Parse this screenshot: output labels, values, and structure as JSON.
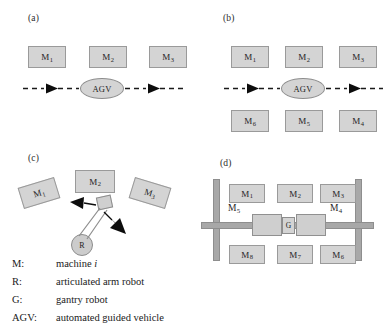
{
  "figure": {
    "panels": [
      {
        "id": "a",
        "label": "(a)",
        "machines": [
          {
            "name": "M",
            "index": "1"
          },
          {
            "name": "M",
            "index": "2"
          },
          {
            "name": "M",
            "index": "3"
          }
        ],
        "vehicle": "AGV"
      },
      {
        "id": "b",
        "label": "(b)",
        "machines_top": [
          {
            "name": "M",
            "index": "1"
          },
          {
            "name": "M",
            "index": "2"
          },
          {
            "name": "M",
            "index": "3"
          }
        ],
        "machines_bottom": [
          {
            "name": "M",
            "index": "6"
          },
          {
            "name": "M",
            "index": "5"
          },
          {
            "name": "M",
            "index": "4"
          }
        ],
        "vehicle": "AGV"
      },
      {
        "id": "c",
        "label": "(c)",
        "machines": [
          {
            "name": "M",
            "index": "1"
          },
          {
            "name": "M",
            "index": "2"
          },
          {
            "name": "M",
            "index": "3"
          }
        ],
        "robot": "R"
      },
      {
        "id": "d",
        "label": "(d)",
        "machines_top": [
          {
            "name": "M",
            "index": "1"
          },
          {
            "name": "M",
            "index": "2"
          },
          {
            "name": "M",
            "index": "3"
          }
        ],
        "machines_mid": [
          {
            "name": "M",
            "index": "5"
          },
          {
            "name": "M",
            "index": "4"
          }
        ],
        "machines_bottom": [
          {
            "name": "M",
            "index": "8"
          },
          {
            "name": "M",
            "index": "7"
          },
          {
            "name": "M",
            "index": "6"
          }
        ],
        "robot": "G"
      }
    ]
  },
  "legend": {
    "rows": [
      {
        "key": "M:",
        "key_sub": "i",
        "value": "machine ",
        "value_italic": "i"
      },
      {
        "key": "R:",
        "key_sub": "",
        "value": "articulated arm robot",
        "value_italic": ""
      },
      {
        "key": "G:",
        "key_sub": "",
        "value": "gantry robot",
        "value_italic": ""
      },
      {
        "key": "AGV:",
        "key_sub": "",
        "value": "automated guided vehicle",
        "value_italic": ""
      }
    ]
  },
  "colors": {
    "machine_fill": "#d4d4d4",
    "machine_stroke": "#9a9a9a",
    "rail_fill": "#a8a8a8",
    "line": "#1a1a1a",
    "background": "#ffffff"
  }
}
